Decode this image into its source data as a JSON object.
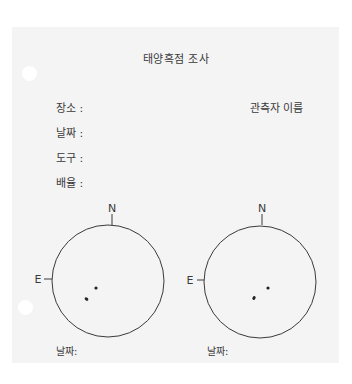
{
  "document": {
    "title": "태양흑점 조사",
    "fields": [
      {
        "label": "장소 :"
      },
      {
        "label": "날짜 :"
      },
      {
        "label": "도구 :"
      },
      {
        "label": "배율 :"
      }
    ],
    "observer_label": "관측자 이름"
  },
  "diagrams": [
    {
      "north_label": "N",
      "east_label": "E",
      "date_label": "날짜:",
      "circle": {
        "cx": 108,
        "cy": 281,
        "r": 56
      },
      "sunspots": [
        {
          "x": 96,
          "y": 288,
          "rx": 1.6,
          "ry": 1.6
        },
        {
          "x": 86.5,
          "y": 299,
          "rx": 2.0,
          "ry": 1.5
        }
      ]
    },
    {
      "north_label": "N",
      "east_label": "E",
      "date_label": "날짜:",
      "circle": {
        "cx": 260,
        "cy": 282,
        "r": 56
      },
      "sunspots": [
        {
          "x": 268,
          "y": 288,
          "rx": 1.6,
          "ry": 1.6
        },
        {
          "x": 254,
          "y": 298,
          "rx": 1.5,
          "ry": 2.0
        }
      ]
    }
  ],
  "colors": {
    "ink": "#3a3a3a",
    "sheet": "#f4f4f4",
    "background": "#ffffff"
  }
}
